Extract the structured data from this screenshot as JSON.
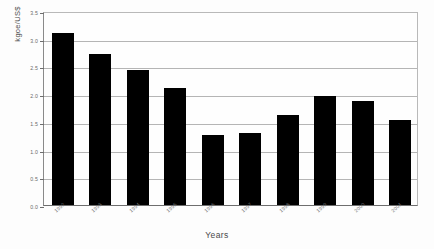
{
  "chart_data": {
    "type": "bar",
    "title": "",
    "subtitle": "",
    "xlabel": "Years",
    "ylabel": "kgoe/US$",
    "categories": [
      "1992",
      "1993",
      "1994",
      "1995",
      "1996",
      "1997",
      "1998",
      "1999",
      "2000",
      "2001"
    ],
    "values": [
      3.1,
      2.73,
      2.44,
      2.12,
      1.27,
      1.3,
      1.63,
      1.97,
      1.88,
      1.54
    ],
    "series": [
      {
        "name": "Energy intensity",
        "values": [
          3.1,
          2.73,
          2.44,
          2.12,
          1.27,
          1.3,
          1.63,
          1.97,
          1.88,
          1.54
        ]
      }
    ],
    "ylim": [
      0.0,
      3.5
    ],
    "yticks": [
      0.0,
      0.5,
      1.0,
      1.5,
      2.0,
      2.5,
      3.0,
      3.5
    ],
    "ytick_labels": [
      "0.0",
      "0.5",
      "1.0",
      "1.5",
      "2.0",
      "2.5",
      "3.0",
      "3.5"
    ],
    "grid": true,
    "grid_axis": "y",
    "legend": false,
    "legend_position": "none",
    "bar_color": "#000000",
    "gridline_color": "#b5b5b5",
    "axis_color": "#6e6e6e",
    "plot_background": "#fefefe",
    "figure_background": "#fdfdfd",
    "annotations": []
  }
}
